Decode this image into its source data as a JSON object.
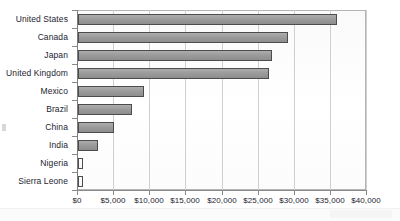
{
  "chart_data": {
    "type": "bar",
    "orientation": "horizontal",
    "title": "",
    "subtitle": "",
    "xlabel": "",
    "ylabel": "",
    "categories": [
      "United States",
      "Canada",
      "Japan",
      "United Kingdom",
      "Mexico",
      "Brazil",
      "China",
      "India",
      "Nigeria",
      "Sierra Leone"
    ],
    "values": [
      35800,
      29100,
      26900,
      26400,
      9150,
      7450,
      5000,
      2750,
      700,
      700
    ],
    "xlim": [
      0,
      40000
    ],
    "xticks": [
      0,
      5000,
      10000,
      15000,
      20000,
      25000,
      30000,
      35000,
      40000
    ],
    "xtick_labels": [
      "$0",
      "$5,000",
      "$10,000",
      "$15,000",
      "$20,000",
      "$25,000",
      "$30,000",
      "$35,000",
      "$40,000"
    ],
    "grid": true,
    "grid_axis": "x",
    "legend": false,
    "legend_position": "none",
    "bar_color": "#9d9d9d",
    "bar_border_color": "#4c4c4c",
    "plot_background": "#fdfdfd",
    "gridline_color": "#cfcfcf",
    "axis_color": "#8a8a8a",
    "text_color": "#1c2430",
    "annotations": []
  }
}
